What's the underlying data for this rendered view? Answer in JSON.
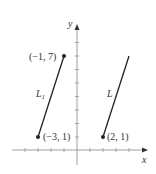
{
  "axes": {
    "x_label": "x",
    "y_label": "y",
    "x_range": [
      -5,
      5
    ],
    "y_range": [
      -1,
      8
    ]
  },
  "lines": [
    {
      "name": "L",
      "subscript": "1",
      "start": {
        "x": -3,
        "y": 1,
        "label": "(−3, 1)"
      },
      "end": {
        "x": -1,
        "y": 7,
        "label": "(−1, 7)"
      }
    },
    {
      "name": "L",
      "subscript": "",
      "start": {
        "x": 2,
        "y": 1,
        "label": "(2, 1)"
      },
      "end": {
        "x": 4,
        "y": 7,
        "label": ""
      }
    }
  ],
  "colors": {
    "line": "#222222",
    "axis": "#888888",
    "text": "#333333"
  }
}
